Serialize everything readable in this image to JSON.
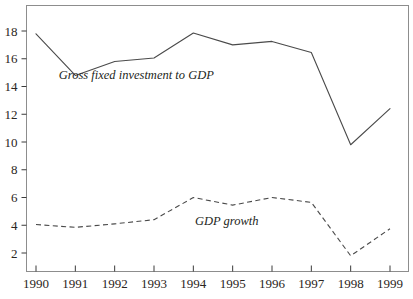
{
  "chart_data": {
    "type": "line",
    "title": "",
    "subtitle": "",
    "xlabel": "",
    "ylabel": "",
    "categories": [
      "1990",
      "1991",
      "1992",
      "1993",
      "1994",
      "1995",
      "1996",
      "1997",
      "1998",
      "1999"
    ],
    "x": [
      1990,
      1991,
      1992,
      1993,
      1994,
      1995,
      1996,
      1997,
      1998,
      1999
    ],
    "xlim": [
      1990,
      1999
    ],
    "ylim": [
      0,
      19.2
    ],
    "ytick_values": [
      2,
      4,
      6,
      8,
      10,
      12,
      14,
      16,
      18
    ],
    "ytick_labels": [
      "2",
      "4",
      "6",
      "8",
      "10",
      "12",
      "14",
      "16",
      "18"
    ],
    "xtick_labels": [
      "1990",
      "1991",
      "1992",
      "1993",
      "1994",
      "1995",
      "1996",
      "1997",
      "1998",
      "1999"
    ],
    "grid": false,
    "legend_position": "inline-annotation",
    "series": [
      {
        "name": "Gross fixed investment to GDP",
        "style": "solid",
        "color": "#4a4a4a",
        "values": [
          17.8,
          14.8,
          15.8,
          16.05,
          17.85,
          17.0,
          17.25,
          16.45,
          9.8,
          12.4
        ],
        "annotation": {
          "text": "Gross fixed investment to GDP",
          "x": 1992.55,
          "y": 14.55
        }
      },
      {
        "name": "GDP growth",
        "style": "dashed",
        "color": "#4a4a4a",
        "values": [
          4.05,
          3.85,
          4.1,
          4.4,
          6.0,
          5.45,
          6.0,
          5.65,
          1.8,
          3.75
        ],
        "annotation": {
          "text": "GDP growth",
          "x": 1994.85,
          "y": 4.05
        }
      }
    ]
  }
}
